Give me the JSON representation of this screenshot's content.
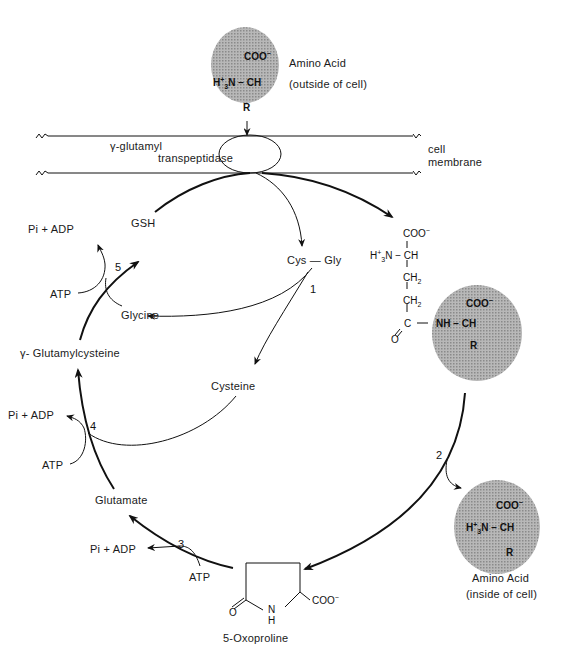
{
  "diagram": {
    "type": "metabolic-cycle",
    "name": "gamma-glutamyl cycle",
    "colors": {
      "line": "#111111",
      "sphere": "#a6a6a6",
      "background": "#ffffff"
    },
    "membrane": {
      "enzyme_line1": "γ-glutamyl",
      "enzyme_line2": "transpeptidase",
      "label_line1": "cell",
      "label_line2": "membrane"
    },
    "amino_acid_outside": {
      "coo": "COO",
      "coo_charge": "−",
      "amine": "H",
      "amine_charge": "+",
      "amine_sub": "3",
      "amine_tail": "N − CH",
      "r": "R",
      "label_line1": "Amino Acid",
      "label_line2": "(outside of cell)"
    },
    "gamma_glutamyl_amino_acid": {
      "coo": "COO",
      "coo_charge": "−",
      "amine": "H",
      "amine_charge": "+",
      "amine_sub": "3",
      "amine_tail": "N − CH",
      "ch2_a": "CH",
      "ch2_b": "CH",
      "sub2": "2",
      "carbonyl": "C",
      "oxygen": "O",
      "nh_link": "NH − CH",
      "aa_coo": "COO",
      "r": "R"
    },
    "amino_acid_inside": {
      "coo": "COO",
      "coo_charge": "−",
      "amine": "H",
      "amine_charge": "+",
      "amine_sub": "3",
      "amine_tail": "N − CH",
      "r": "R",
      "label_line1": "Amino Acid",
      "label_line2": "(inside of cell)"
    },
    "metabolites": {
      "gsh": "GSH",
      "cys_gly": "Cys — Gly",
      "glycine": "Glycine",
      "gamma_glutamylcysteine": "γ- Glutamylcysteine",
      "cysteine": "Cysteine",
      "glutamate": "Glutamate",
      "oxoproline": "5-Oxoproline",
      "oxoproline_o": "O",
      "oxoproline_n": "N",
      "oxoproline_h": "H",
      "oxoproline_coo": "COO"
    },
    "steps": [
      "1",
      "2",
      "3",
      "4",
      "5"
    ],
    "cofactors": {
      "step5_out": "Pi + ADP",
      "step5_in": "ATP",
      "step4_out": "Pi + ADP",
      "step4_in": "ATP",
      "step3_out": "Pi + ADP",
      "step3_in": "ATP"
    }
  }
}
